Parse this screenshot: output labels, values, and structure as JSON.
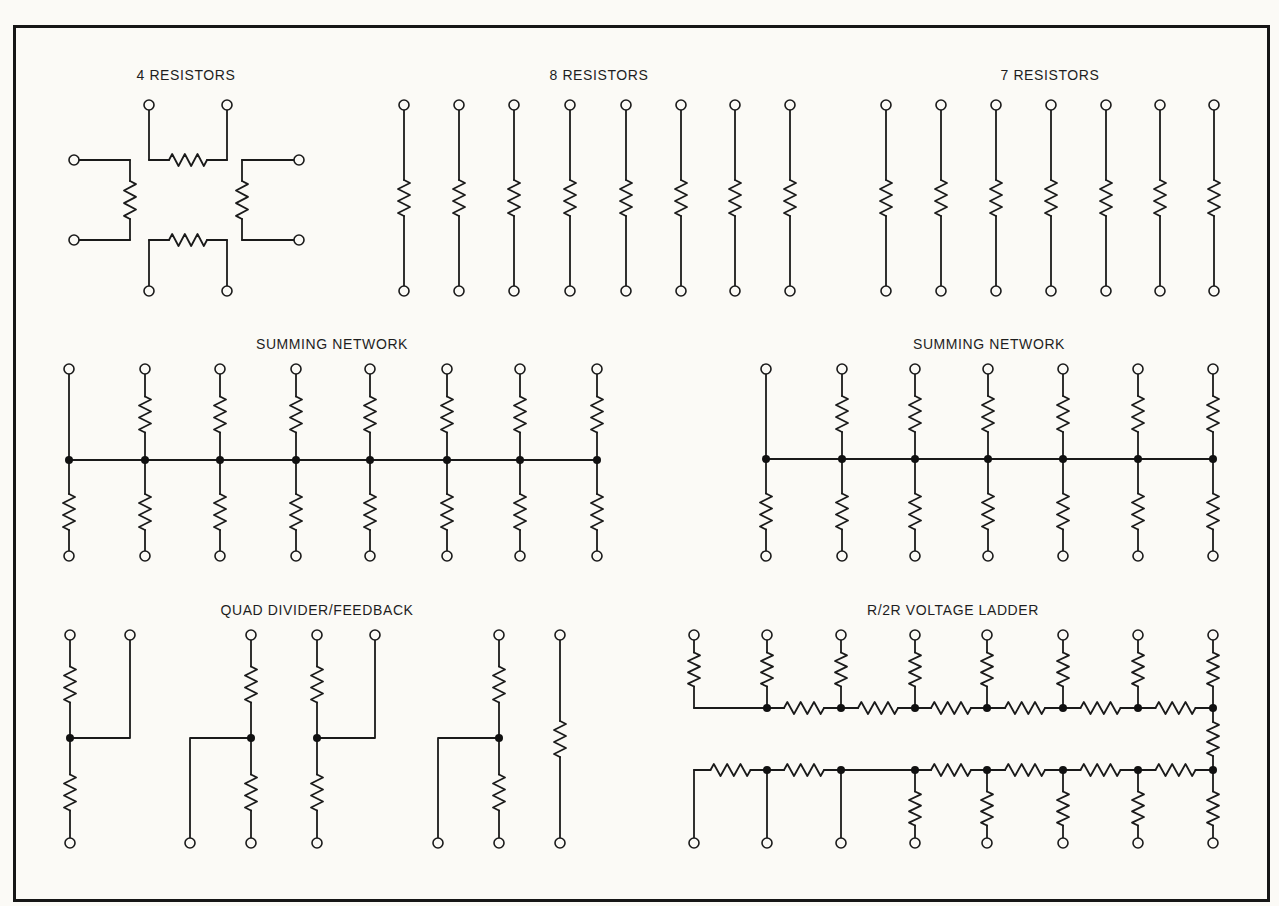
{
  "diagram": {
    "border": {
      "x": 14,
      "y": 26,
      "w": 1253,
      "h": 873
    },
    "colors": {
      "ink": "#1a1a1a",
      "paper": "#fbfaf6"
    },
    "sections": [
      {
        "id": "four-resistors",
        "title": "4 RESISTORS",
        "title_x": 186,
        "title_y": 80
      },
      {
        "id": "eight-resistors",
        "title": "8 RESISTORS",
        "title_x": 599,
        "title_y": 80
      },
      {
        "id": "seven-resistors",
        "title": "7 RESISTORS",
        "title_x": 1050,
        "title_y": 80
      },
      {
        "id": "summing-network-1",
        "title": "SUMMING NETWORK",
        "title_x": 332,
        "title_y": 349
      },
      {
        "id": "summing-network-2",
        "title": "SUMMING NETWORK",
        "title_x": 989,
        "title_y": 349
      },
      {
        "id": "quad-divider-feedback",
        "title": "QUAD DIVIDER/FEEDBACK",
        "title_x": 317,
        "title_y": 615
      },
      {
        "id": "r2r-voltage-ladder",
        "title": "R/2R VOLTAGE LADDER",
        "title_x": 953,
        "title_y": 615
      }
    ],
    "four_resistors": {
      "top_terminals": [
        [
          149,
          105
        ],
        [
          227,
          105
        ]
      ],
      "bottom_terminals": [
        [
          149,
          291
        ],
        [
          227,
          291
        ]
      ],
      "left_terminals": [
        [
          74,
          160
        ],
        [
          74,
          240
        ]
      ],
      "right_terminals": [
        [
          299,
          160
        ],
        [
          299,
          240
        ]
      ]
    },
    "eight_resistors": {
      "x": [
        404,
        459,
        514,
        570,
        626,
        681,
        735,
        790
      ],
      "y_top": 105,
      "y_bottom": 291,
      "res_y": 198
    },
    "seven_resistors": {
      "x": [
        886,
        941,
        996,
        1051,
        1106,
        1160,
        1214
      ],
      "y_top": 105,
      "y_bottom": 291,
      "res_y": 198
    },
    "summing_network_1": {
      "x": [
        69,
        145,
        220,
        296,
        370,
        447,
        520,
        597
      ],
      "y_top": 369,
      "y_bus": 460,
      "y_bottom": 556,
      "top_resistor": [
        false,
        true,
        true,
        true,
        true,
        true,
        true,
        true
      ]
    },
    "summing_network_2": {
      "x": [
        766,
        842,
        915,
        988,
        1063,
        1138,
        1213
      ],
      "y_top": 369,
      "y_bus": 459,
      "y_bottom": 556,
      "top_resistor": [
        false,
        true,
        true,
        true,
        true,
        true,
        true
      ]
    },
    "quad_divider": {
      "units": [
        {
          "main_x": 70,
          "side_x": 130,
          "side": "right",
          "side_top": true
        },
        {
          "main_x": 251,
          "side_x": 190,
          "side": "left",
          "side_top": false
        },
        {
          "main_x": 317,
          "side_x": 375,
          "side": "right",
          "side_top": true
        },
        {
          "main_x": 499,
          "side_x": 438,
          "side": "left",
          "side_top": false
        }
      ],
      "single": {
        "x": 560
      },
      "y_top": 635,
      "y_node": 738,
      "y_bottom": 843
    },
    "r2r_ladder": {
      "x": [
        694,
        767,
        841,
        915,
        987,
        1063,
        1138,
        1213
      ],
      "y_top": 635,
      "y_rail_top": 708,
      "y_rail_bottom": 770,
      "y_bottom": 843,
      "top_rail_resistors": [
        false,
        true,
        true,
        true,
        true,
        true,
        true
      ],
      "bottom_rail_resistors": [
        true,
        true,
        false,
        true,
        true,
        true,
        true
      ],
      "bottom_branch_resistor": [
        false,
        false,
        false,
        true,
        true,
        true,
        true,
        true
      ]
    }
  }
}
